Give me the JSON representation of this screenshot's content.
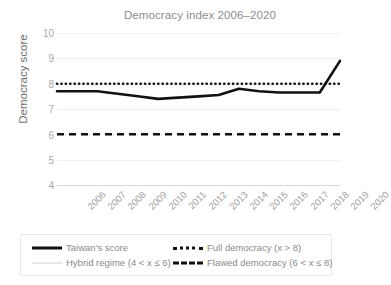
{
  "chart_data": {
    "type": "line",
    "title": "Democracy index 2006–2020",
    "xlabel": "",
    "ylabel": "Democracy score",
    "ylim": [
      4,
      10
    ],
    "yticks": [
      4,
      5,
      6,
      7,
      8,
      9,
      10
    ],
    "grid": true,
    "legend_position": "bottom",
    "categories": [
      "2006",
      "2007",
      "2008",
      "2009",
      "2010",
      "2011",
      "2012",
      "2013",
      "2014",
      "2015",
      "2016",
      "2017",
      "2018",
      "2019",
      "2020"
    ],
    "series": [
      {
        "name": "Taiwan's score",
        "style": "solid",
        "color": "#111111",
        "values": [
          7.7,
          7.7,
          7.7,
          7.6,
          7.5,
          7.4,
          7.45,
          7.5,
          7.55,
          7.8,
          7.7,
          7.65,
          7.65,
          7.65,
          8.9
        ]
      }
    ],
    "reference_lines": [
      {
        "name": "Full democracy (x > 8)",
        "value": 8,
        "style": "dotted",
        "color": "#111111"
      },
      {
        "name": "Flawed democracy (6 < x ≤ 8)",
        "value": 6,
        "style": "dashed",
        "color": "#111111"
      },
      {
        "name": "Hybrid regime (4 < x ≤ 6)",
        "value": 4,
        "style": "solid-thin",
        "color": "#cfcfcf"
      }
    ]
  },
  "legend": {
    "taiwan": "Taiwan's score",
    "full_democracy": "Full democracy (x > 8)",
    "hybrid_regime": "Hybrid regime (4 < x ≤ 6)",
    "flawed_democracy": "Flawed democracy (6 < x ≤ 8)"
  },
  "yticks": {
    "t10": "10",
    "t9": "9",
    "t8": "8",
    "t7": "7",
    "t6": "6",
    "t5": "5",
    "t4": "4"
  },
  "xticks": {
    "x2006": "2006",
    "x2007": "2007",
    "x2008": "2008",
    "x2009": "2009",
    "x2010": "2010",
    "x2011": "2011",
    "x2012": "2012",
    "x2013": "2013",
    "x2014": "2014",
    "x2015": "2015",
    "x2016": "2016",
    "x2017": "2017",
    "x2018": "2018",
    "x2019": "2019",
    "x2020": "2020"
  }
}
